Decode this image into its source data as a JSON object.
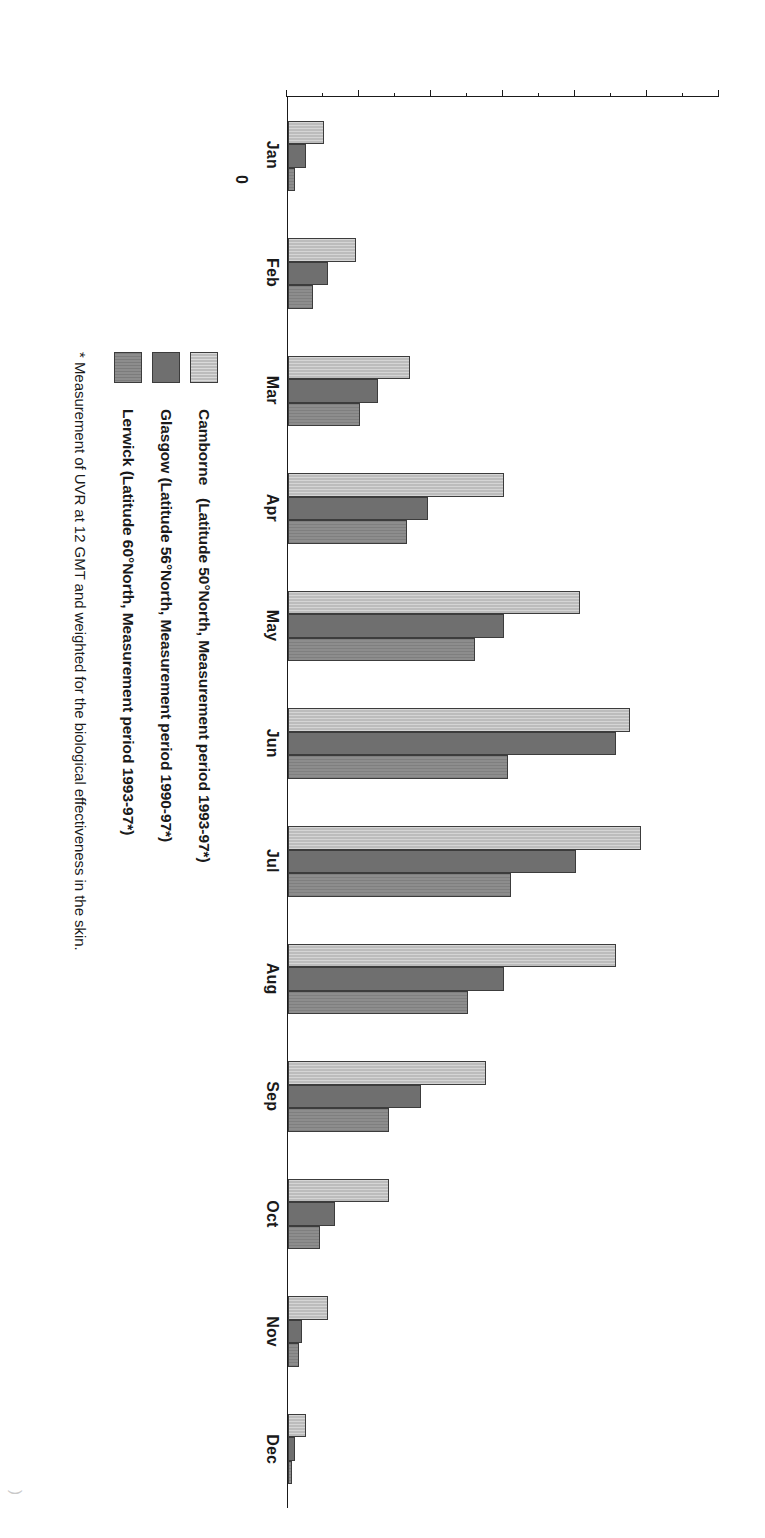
{
  "chart_data": {
    "type": "bar",
    "title": "",
    "xlabel": "",
    "ylabel": "Effective UVR irradiance (Milliwatts per sq. metre)",
    "ylabel_lines": [
      "Effective UVR irradiance",
      "(Milliwatts per sq. metre)"
    ],
    "ylim": [
      0,
      120
    ],
    "ytick_step": 20,
    "yminor_step": 10,
    "grid": false,
    "legend_position": "below-left",
    "categories": [
      "Jan",
      "Feb",
      "Mar",
      "Apr",
      "May",
      "Jun",
      "Jul",
      "Aug",
      "Sep",
      "Oct",
      "Nov",
      "Dec"
    ],
    "yticks": [
      "0",
      "20",
      "40",
      "60",
      "80",
      "100",
      "120"
    ],
    "series": [
      {
        "name": "Camborne",
        "legend_label": "Camborne   (Latitude 50°North, Measurement period 1993-97*)",
        "color": "#bcbcbc",
        "values": [
          10,
          19,
          34,
          60,
          81,
          95,
          98,
          91,
          55,
          28,
          11,
          5
        ]
      },
      {
        "name": "Glasgow",
        "legend_label": "Glasgow (Latitude 56°North, Measurement period 1990-97*)",
        "color": "#6f6f6f",
        "values": [
          5,
          11,
          25,
          39,
          60,
          91,
          80,
          60,
          37,
          13,
          4,
          2
        ]
      },
      {
        "name": "Lerwick",
        "legend_label": "Lerwick (Latitude 60°North, Measurement period 1993-97*)",
        "color": "#8d8d8d",
        "values": [
          2,
          7,
          20,
          33,
          52,
          61,
          62,
          50,
          28,
          9,
          3,
          1
        ]
      }
    ],
    "annotations": [
      "* Measurement of UVR at 12 GMT and weighted for the biological effectiveness in the skin."
    ]
  },
  "footnote": "* Measurement of UVR at 12 GMT and weighted for the biological effectiveness in the skin.",
  "page_artifact": ")"
}
